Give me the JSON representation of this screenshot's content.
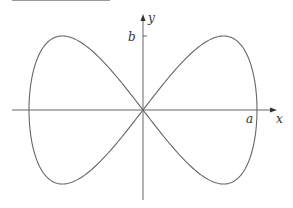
{
  "figure": {
    "axes": {
      "x_label": "x",
      "y_label": "y",
      "x_tick_label": "a",
      "y_tick_label": "b"
    },
    "curve": {
      "type": "parametric",
      "x_expr": "a sin t",
      "y_expr": "b sin 2t",
      "stroke_color": "#666666"
    },
    "axis_color": "#555555",
    "top_rule_color": "#9a9a9a"
  }
}
